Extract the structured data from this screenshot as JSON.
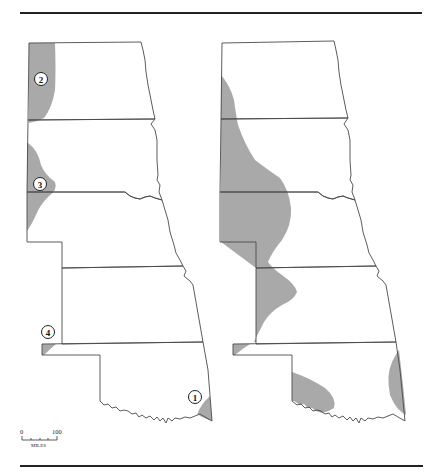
{
  "figure": {
    "colors": {
      "shading": "#a9a9a9",
      "border": "#4a4a4a",
      "rule": "#222222",
      "background": "#ffffff"
    }
  },
  "maps": [
    {
      "id": "left",
      "shaded_regions": [
        "western North Dakota strip",
        "western South Dakota / Nebraska border bulge",
        "Oklahoma panhandle corner",
        "southeastern Oklahoma corner"
      ],
      "labels": [
        {
          "text": "1",
          "x": 195,
          "y": 397
        },
        {
          "text": "2",
          "x": 41,
          "y": 79
        },
        {
          "text": "3",
          "x": 40,
          "y": 184
        },
        {
          "text": "4",
          "x": 48,
          "y": 332
        }
      ]
    },
    {
      "id": "right",
      "shaded_regions": [
        "broad western band from South Dakota through Nebraska into western Kansas",
        "Oklahoma panhandle corner",
        "south-central Oklahoma",
        "eastern Oklahoma edge"
      ],
      "labels": []
    }
  ],
  "scale_bar": {
    "start_label": "0",
    "end_label": "100",
    "unit_label": "MILES"
  }
}
